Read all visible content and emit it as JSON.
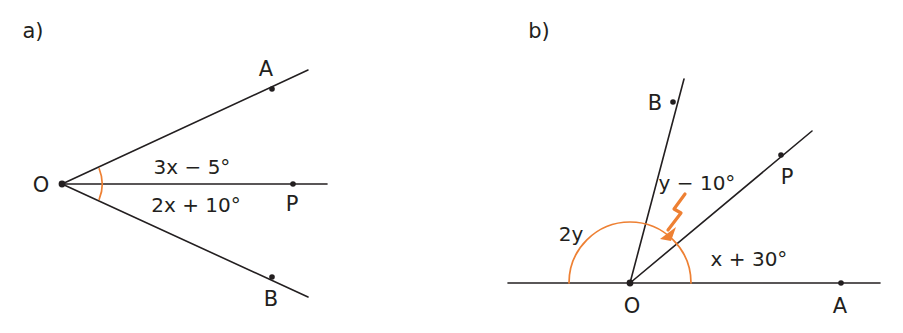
{
  "figure": {
    "background_color": "#ffffff",
    "line_color": "#231f20",
    "accent_color": "#ee8033",
    "width": 903,
    "height": 333
  },
  "panel_a": {
    "letter": "a)",
    "vertex_label": "O",
    "point_labels": {
      "a": "A",
      "b": "B",
      "p": "P"
    },
    "upper_angle_expression": "3x − 5°",
    "lower_angle_expression": "2x + 10°",
    "geometry": {
      "vertex": [
        62,
        184
      ],
      "ray_a_end": [
        308,
        70
      ],
      "ray_b_end": [
        308,
        297
      ],
      "ray_p_end": [
        327,
        184
      ],
      "dot_a": [
        272,
        89
      ],
      "dot_b": [
        272,
        277
      ],
      "dot_p": [
        293,
        184
      ],
      "arc_radius": 41
    }
  },
  "panel_b": {
    "letter": "b)",
    "vertex_label": "O",
    "point_labels": {
      "a": "A",
      "b": "B",
      "p": "P"
    },
    "big_angle_expression": "2y",
    "middle_angle_expression": "y − 10°",
    "lower_angle_expression": "x + 30°",
    "geometry": {
      "vertex": [
        630,
        283
      ],
      "baseline_start": [
        508,
        283
      ],
      "baseline_end": [
        880,
        283
      ],
      "ray_b_end": [
        684,
        79
      ],
      "ray_p_end": [
        812,
        131
      ],
      "dot_a": [
        841,
        283
      ],
      "dot_b": [
        673,
        102
      ],
      "dot_p": [
        781,
        155
      ],
      "arc_radius": 61,
      "pointer_from": [
        684,
        196
      ],
      "pointer_to": [
        661,
        235
      ]
    }
  }
}
